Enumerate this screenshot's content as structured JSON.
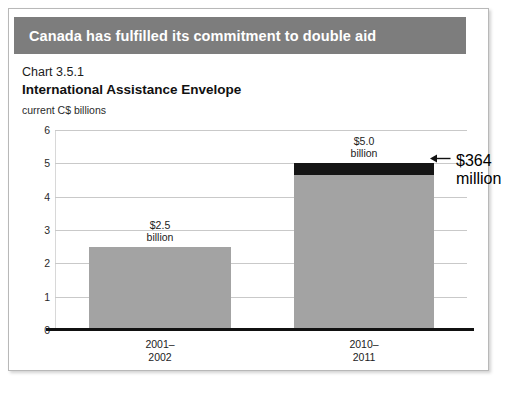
{
  "banner": {
    "title": "Canada has fulfilled its commitment to double aid",
    "background_color": "#7d7d7d",
    "text_color": "#ffffff"
  },
  "figure": {
    "chart_number": "Chart 3.5.1",
    "title": "International Assistance Envelope",
    "unit_label": "current C$ billions"
  },
  "callout": {
    "arrow_icon": "left-arrow-icon",
    "line1": "$364",
    "line2": "million"
  },
  "chart_data": {
    "type": "bar",
    "title": "International Assistance Envelope",
    "subtitle": "Chart 3.5.1",
    "xlabel": "",
    "ylabel": "current C$ billions",
    "ylim": [
      0,
      6
    ],
    "yticks": [
      0,
      1,
      2,
      3,
      4,
      5,
      6
    ],
    "ytick_labels": [
      "0",
      "1",
      "2",
      "3",
      "4",
      "5",
      "6"
    ],
    "grid": true,
    "legend": false,
    "categories": [
      "2001–\n2002",
      "2010–\n2011"
    ],
    "category_lines": [
      [
        "2001–",
        "2002"
      ],
      [
        "2010–",
        "2011"
      ]
    ],
    "values": [
      2.5,
      5.0
    ],
    "data_labels": [
      {
        "line1": "$2.5",
        "line2": "billion"
      },
      {
        "line1": "$5.0",
        "line2": "billion"
      }
    ],
    "series": [
      {
        "name": "International Assistance Envelope",
        "values": [
          2.5,
          5.0
        ],
        "color": "#a3a3a3"
      }
    ],
    "highlight_segment": {
      "name": "Budget 2010 increase",
      "category": "2010–2011",
      "value": 0.364,
      "label": "$364 million",
      "color": "#151515",
      "from": 4.636,
      "to": 5.0
    },
    "annotations": [
      {
        "text": "$364 million",
        "target_category": "2010–2011",
        "target_value": 4.82
      }
    ]
  }
}
